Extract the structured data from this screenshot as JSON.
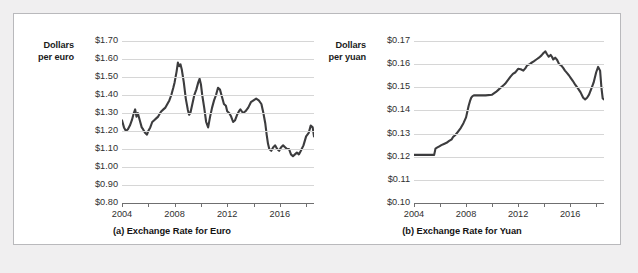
{
  "figure": {
    "background_color": "#f0eff0",
    "panel_color": "#ffffff",
    "panel_border_color": "#b9b9bc",
    "line_color": "#3c3c3e",
    "grid_color": "#d6d6d6",
    "axis_color": "#6f6f70"
  },
  "charts": [
    {
      "id": "euro",
      "caption": "(a) Exchange Rate for Euro",
      "axis_title_line1": "Dollars",
      "axis_title_line2": "per euro",
      "yticks": [
        "$1.70",
        "$1.60",
        "$1.50",
        "$1.40",
        "$1.30",
        "$1.20",
        "$1.10",
        "$1.00",
        "$0.90",
        "$0.80"
      ],
      "xticks": [
        "2004",
        "2008",
        "2012",
        "2016"
      ]
    },
    {
      "id": "yuan",
      "caption": "(b) Exchange Rate for Yuan",
      "axis_title_line1": "Dollars",
      "axis_title_line2": "per yuan",
      "yticks": [
        "$0.17",
        "$0.16",
        "$0.15",
        "$0.14",
        "$0.13",
        "$0.12",
        "$0.11",
        "$0.10"
      ],
      "xticks": [
        "2004",
        "2008",
        "2012",
        "2016"
      ]
    }
  ],
  "chart_data": [
    {
      "type": "line",
      "title": "(a) Exchange Rate for Euro",
      "xlabel": "",
      "ylabel": "Dollars per euro",
      "xlim": [
        2004.0,
        2018.6
      ],
      "ylim": [
        0.8,
        1.7
      ],
      "ytick_values": [
        0.8,
        0.9,
        1.0,
        1.1,
        1.2,
        1.3,
        1.4,
        1.5,
        1.6,
        1.7
      ],
      "ytick_labels": [
        "$0.80",
        "$0.90",
        "$1.00",
        "$1.10",
        "$1.20",
        "$1.30",
        "$1.40",
        "$1.50",
        "$1.60",
        "$1.70"
      ],
      "xtick_values": [
        2004,
        2006,
        2008,
        2010,
        2012,
        2014,
        2016,
        2018
      ],
      "xtick_labels_shown": [
        "2004",
        "2008",
        "2012",
        "2016"
      ],
      "grid": "horizontal",
      "legend": "none",
      "series": [
        {
          "name": "Dollars per euro",
          "x": [
            2004.0,
            2004.15,
            2004.3,
            2004.45,
            2004.6,
            2004.75,
            2004.9,
            2005.0,
            2005.1,
            2005.2,
            2005.35,
            2005.5,
            2005.6,
            2005.75,
            2005.9,
            2006.0,
            2006.15,
            2006.3,
            2006.45,
            2006.6,
            2006.75,
            2006.9,
            2007.0,
            2007.15,
            2007.3,
            2007.45,
            2007.6,
            2007.75,
            2007.9,
            2008.0,
            2008.15,
            2008.25,
            2008.35,
            2008.45,
            2008.55,
            2008.7,
            2008.85,
            2009.0,
            2009.1,
            2009.2,
            2009.35,
            2009.5,
            2009.65,
            2009.8,
            2009.9,
            2010.0,
            2010.1,
            2010.25,
            2010.4,
            2010.55,
            2010.7,
            2010.85,
            2011.0,
            2011.15,
            2011.3,
            2011.45,
            2011.6,
            2011.75,
            2011.9,
            2012.0,
            2012.15,
            2012.3,
            2012.45,
            2012.6,
            2012.75,
            2012.9,
            2013.0,
            2013.2,
            2013.4,
            2013.6,
            2013.8,
            2014.0,
            2014.2,
            2014.4,
            2014.6,
            2014.75,
            2014.9,
            2015.0,
            2015.1,
            2015.2,
            2015.35,
            2015.5,
            2015.65,
            2015.8,
            2015.95,
            2016.1,
            2016.25,
            2016.4,
            2016.55,
            2016.7,
            2016.85,
            2017.0,
            2017.15,
            2017.3,
            2017.45,
            2017.6,
            2017.8,
            2018.0,
            2018.2,
            2018.35,
            2018.5,
            2018.6
          ],
          "y": [
            1.26,
            1.22,
            1.2,
            1.21,
            1.23,
            1.26,
            1.3,
            1.32,
            1.28,
            1.3,
            1.26,
            1.22,
            1.21,
            1.19,
            1.18,
            1.2,
            1.22,
            1.25,
            1.26,
            1.27,
            1.28,
            1.3,
            1.31,
            1.32,
            1.33,
            1.35,
            1.37,
            1.4,
            1.44,
            1.47,
            1.53,
            1.58,
            1.56,
            1.57,
            1.54,
            1.47,
            1.38,
            1.32,
            1.29,
            1.3,
            1.35,
            1.4,
            1.43,
            1.47,
            1.49,
            1.46,
            1.4,
            1.33,
            1.25,
            1.22,
            1.28,
            1.33,
            1.37,
            1.4,
            1.44,
            1.43,
            1.39,
            1.35,
            1.34,
            1.31,
            1.3,
            1.28,
            1.25,
            1.26,
            1.29,
            1.31,
            1.32,
            1.3,
            1.31,
            1.33,
            1.36,
            1.37,
            1.38,
            1.37,
            1.35,
            1.3,
            1.24,
            1.18,
            1.13,
            1.1,
            1.09,
            1.11,
            1.12,
            1.1,
            1.09,
            1.11,
            1.12,
            1.11,
            1.1,
            1.1,
            1.07,
            1.06,
            1.07,
            1.08,
            1.07,
            1.09,
            1.12,
            1.17,
            1.19,
            1.23,
            1.22,
            1.17,
            1.14
          ]
        }
      ]
    },
    {
      "type": "line",
      "title": "(b) Exchange Rate for Yuan",
      "xlabel": "",
      "ylabel": "Dollars per yuan",
      "xlim": [
        2004.0,
        2018.6
      ],
      "ylim": [
        0.1,
        0.17
      ],
      "ytick_values": [
        0.1,
        0.11,
        0.12,
        0.13,
        0.14,
        0.15,
        0.16,
        0.17
      ],
      "ytick_labels": [
        "$0.10",
        "$0.11",
        "$0.12",
        "$0.13",
        "$0.14",
        "$0.15",
        "$0.16",
        "$0.17"
      ],
      "xtick_values": [
        2004,
        2006,
        2008,
        2010,
        2012,
        2014,
        2016,
        2018
      ],
      "xtick_labels_shown": [
        "2004",
        "2008",
        "2012",
        "2016"
      ],
      "grid": "horizontal",
      "legend": "none",
      "series": [
        {
          "name": "Dollars per yuan",
          "x": [
            2004.0,
            2004.5,
            2005.0,
            2005.3,
            2005.55,
            2005.65,
            2005.8,
            2005.95,
            2006.1,
            2006.3,
            2006.5,
            2006.7,
            2006.9,
            2007.0,
            2007.2,
            2007.4,
            2007.6,
            2007.8,
            2008.0,
            2008.1,
            2008.2,
            2008.3,
            2008.4,
            2008.5,
            2008.6,
            2008.75,
            2009.0,
            2009.5,
            2010.0,
            2010.3,
            2010.5,
            2010.7,
            2010.9,
            2011.0,
            2011.2,
            2011.4,
            2011.6,
            2011.8,
            2012.0,
            2012.2,
            2012.4,
            2012.55,
            2012.7,
            2012.9,
            2013.0,
            2013.2,
            2013.4,
            2013.6,
            2013.8,
            2013.95,
            2014.1,
            2014.2,
            2014.35,
            2014.5,
            2014.6,
            2014.7,
            2014.85,
            2015.0,
            2015.15,
            2015.3,
            2015.45,
            2015.6,
            2015.75,
            2015.9,
            2016.05,
            2016.2,
            2016.4,
            2016.6,
            2016.8,
            2017.0,
            2017.15,
            2017.3,
            2017.45,
            2017.6,
            2017.8,
            2018.0,
            2018.15,
            2018.3,
            2018.4,
            2018.5,
            2018.6
          ],
          "y": [
            0.1208,
            0.1208,
            0.1208,
            0.1208,
            0.1208,
            0.1235,
            0.124,
            0.1245,
            0.125,
            0.1255,
            0.126,
            0.1268,
            0.1275,
            0.1285,
            0.1295,
            0.131,
            0.1325,
            0.1345,
            0.137,
            0.1395,
            0.142,
            0.144,
            0.1455,
            0.1462,
            0.1465,
            0.1465,
            0.1465,
            0.1465,
            0.1468,
            0.148,
            0.149,
            0.15,
            0.151,
            0.1515,
            0.153,
            0.1545,
            0.1558,
            0.1565,
            0.158,
            0.1578,
            0.1572,
            0.1582,
            0.1595,
            0.16,
            0.1605,
            0.1612,
            0.162,
            0.1628,
            0.1638,
            0.1648,
            0.1655,
            0.1645,
            0.1632,
            0.164,
            0.1632,
            0.162,
            0.1628,
            0.1618,
            0.16,
            0.1595,
            0.1585,
            0.1572,
            0.1562,
            0.1552,
            0.154,
            0.1528,
            0.151,
            0.1495,
            0.1478,
            0.1455,
            0.1448,
            0.1455,
            0.1468,
            0.149,
            0.152,
            0.1565,
            0.1588,
            0.1572,
            0.15,
            0.1452,
            0.1448
          ]
        }
      ]
    }
  ]
}
